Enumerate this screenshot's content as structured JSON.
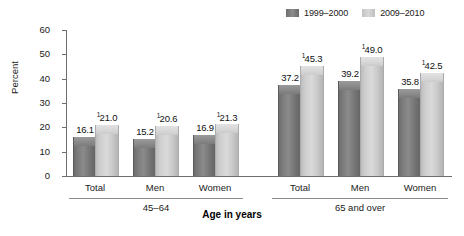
{
  "chart_data": {
    "type": "bar",
    "title": "",
    "xlabel": "Age in years",
    "ylabel": "Percent",
    "ylim": [
      0,
      60
    ],
    "yticks": [
      0,
      10,
      20,
      30,
      40,
      50,
      60
    ],
    "grid": false,
    "legend_position": "top-right",
    "categories": [
      "Total",
      "Men",
      "Women",
      "Total",
      "Men",
      "Women"
    ],
    "groups": [
      {
        "label": "45–64",
        "categories": [
          "Total",
          "Men",
          "Women"
        ]
      },
      {
        "label": "65 and over",
        "categories": [
          "Total",
          "Men",
          "Women"
        ]
      }
    ],
    "series": [
      {
        "name": "1999–2000",
        "color": "#7f7f7f",
        "values": [
          16.1,
          15.2,
          16.9,
          37.2,
          39.2,
          35.8
        ],
        "labels": [
          "16.1",
          "15.2",
          "16.9",
          "37.2",
          "39.2",
          "35.8"
        ],
        "footnotes": [
          "",
          "",
          "",
          "",
          "",
          ""
        ]
      },
      {
        "name": "2009–2010",
        "color": "#cccccc",
        "values": [
          21.0,
          20.6,
          21.3,
          45.3,
          49.0,
          42.5
        ],
        "labels": [
          "21.0",
          "20.6",
          "21.3",
          "45.3",
          "49.0",
          "42.5"
        ],
        "footnotes": [
          "1",
          "1",
          "1",
          "1",
          "1",
          "1"
        ]
      }
    ]
  },
  "legend": {
    "entries": [
      {
        "label": "1999–2000",
        "swatch": "#7f7f7f"
      },
      {
        "label": "2009–2010",
        "swatch": "#cccccc"
      }
    ]
  },
  "axis": {
    "y_label": "Percent",
    "y_ticks": [
      "60",
      "50",
      "40",
      "30",
      "20",
      "10",
      "0"
    ],
    "x_title": "Age in years"
  },
  "bars": [
    {
      "cat": "Total",
      "group": 0,
      "series": "1999–2000",
      "label": "16.1",
      "fn": "",
      "value": 16.1
    },
    {
      "cat": "Total",
      "group": 0,
      "series": "2009–2010",
      "label": "21.0",
      "fn": "1",
      "value": 21.0
    },
    {
      "cat": "Men",
      "group": 0,
      "series": "1999–2000",
      "label": "15.2",
      "fn": "",
      "value": 15.2
    },
    {
      "cat": "Men",
      "group": 0,
      "series": "2009–2010",
      "label": "20.6",
      "fn": "1",
      "value": 20.6
    },
    {
      "cat": "Women",
      "group": 0,
      "series": "1999–2000",
      "label": "16.9",
      "fn": "",
      "value": 16.9
    },
    {
      "cat": "Women",
      "group": 0,
      "series": "2009–2010",
      "label": "21.3",
      "fn": "1",
      "value": 21.3
    },
    {
      "cat": "Total",
      "group": 1,
      "series": "1999–2000",
      "label": "37.2",
      "fn": "",
      "value": 37.2
    },
    {
      "cat": "Total",
      "group": 1,
      "series": "2009–2010",
      "label": "45.3",
      "fn": "1",
      "value": 45.3
    },
    {
      "cat": "Men",
      "group": 1,
      "series": "1999–2000",
      "label": "39.2",
      "fn": "",
      "value": 39.2
    },
    {
      "cat": "Men",
      "group": 1,
      "series": "2009–2010",
      "label": "49.0",
      "fn": "1",
      "value": 49.0
    },
    {
      "cat": "Women",
      "group": 1,
      "series": "1999–2000",
      "label": "35.8",
      "fn": "",
      "value": 35.8
    },
    {
      "cat": "Women",
      "group": 1,
      "series": "2009–2010",
      "label": "42.5",
      "fn": "1",
      "value": 42.5
    }
  ],
  "category_labels": [
    "Total",
    "Men",
    "Women",
    "Total",
    "Men",
    "Women"
  ],
  "group_labels": [
    "45–64",
    "65 and over"
  ]
}
